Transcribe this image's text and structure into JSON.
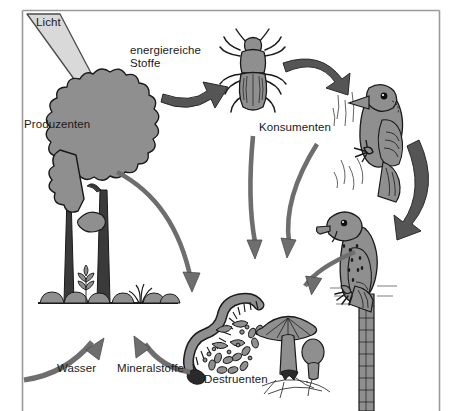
{
  "diagram": {
    "language": "de",
    "colors": {
      "background": "#ffffff",
      "frame_line": "#9a9a9a",
      "organism_fill": "#8f8f8f",
      "organism_outline": "#1a1a1a",
      "dark_arrow": "#555555",
      "mid_arrow": "#6e6e6e",
      "light_arrow": "#d9d9d9",
      "text": "#1a1a1a"
    },
    "labels": {
      "light": "Licht",
      "producers": "Produzenten",
      "energy_rich_matter_line1": "energiereiche",
      "energy_rich_matter_line2": "Stoffe",
      "consumers": "Konsumenten",
      "decomposers": "Destruenten",
      "water": "Wasser",
      "minerals": "Mineralstoffe"
    },
    "organisms": [
      {
        "name": "tree",
        "role": "producer",
        "label": "Produzenten"
      },
      {
        "name": "beetle",
        "role": "primary-consumer",
        "label": "Konsumenten"
      },
      {
        "name": "woodpecker",
        "role": "secondary-consumer",
        "label": "Konsumenten"
      },
      {
        "name": "falcon",
        "role": "tertiary-consumer",
        "label": "Konsumenten"
      },
      {
        "name": "earthworm",
        "role": "decomposer",
        "label": "Destruenten"
      },
      {
        "name": "bacteria",
        "role": "decomposer",
        "label": "Destruenten"
      },
      {
        "name": "mushroom",
        "role": "decomposer",
        "label": "Destruenten"
      }
    ],
    "flows": [
      {
        "from": "sun",
        "to": "tree",
        "label": "Licht",
        "style": "light"
      },
      {
        "from": "tree",
        "to": "beetle",
        "label": "energiereiche Stoffe",
        "style": "dark"
      },
      {
        "from": "beetle",
        "to": "woodpecker",
        "label": "",
        "style": "dark"
      },
      {
        "from": "woodpecker",
        "to": "falcon",
        "label": "",
        "style": "dark"
      },
      {
        "from": "tree",
        "to": "decomposers",
        "label": "",
        "style": "mid"
      },
      {
        "from": "beetle",
        "to": "decomposers",
        "label": "",
        "style": "mid"
      },
      {
        "from": "woodpecker",
        "to": "decomposers",
        "label": "",
        "style": "mid"
      },
      {
        "from": "falcon",
        "to": "decomposers",
        "label": "",
        "style": "mid"
      },
      {
        "from": "soil",
        "to": "tree",
        "label": "Wasser",
        "style": "mid"
      },
      {
        "from": "decomposers",
        "to": "tree",
        "label": "Mineralstoffe",
        "style": "mid"
      }
    ]
  }
}
